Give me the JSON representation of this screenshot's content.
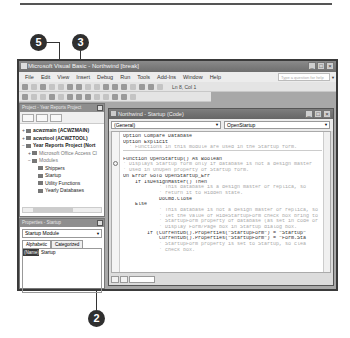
{
  "callouts": [
    {
      "number": "5"
    },
    {
      "number": "3"
    },
    {
      "number": "2"
    }
  ],
  "window": {
    "title": "Microsoft Visual Basic - Northwind [break]",
    "controls": [
      "_",
      "□",
      "×"
    ],
    "help_placeholder": "Type a question for help"
  },
  "menubar": [
    "File",
    "Edit",
    "View",
    "Insert",
    "Debug",
    "Run",
    "Tools",
    "Add-Ins",
    "Window",
    "Help"
  ],
  "toolbar": {
    "position": "Ln 8, Col 1"
  },
  "project_pane": {
    "title": "Project - Year Reports Project",
    "items": [
      {
        "toggle": "+",
        "label": "acwzmain (ACWZMAIN)",
        "bold": true,
        "indent": 0
      },
      {
        "toggle": "+",
        "label": "acwztool (ACWZTOOL)",
        "bold": true,
        "indent": 0
      },
      {
        "toggle": "−",
        "label": "Year Reports Project (Nort",
        "bold": true,
        "indent": 0
      },
      {
        "toggle": "+",
        "label": "Microsoft Office Access Cl",
        "bold": false,
        "indent": 1
      },
      {
        "toggle": "−",
        "label": "Modules",
        "bold": false,
        "indent": 1
      },
      {
        "toggle": "",
        "label": "Shippers",
        "bold": false,
        "indent": 2
      },
      {
        "toggle": "",
        "label": "Startup",
        "bold": false,
        "indent": 2
      },
      {
        "toggle": "",
        "label": "Utility Functions",
        "bold": false,
        "indent": 2
      },
      {
        "toggle": "",
        "label": "Yearly Databases",
        "bold": false,
        "indent": 2
      }
    ]
  },
  "properties_pane": {
    "title": "Properties - Startup",
    "selected_object": "Startup Module",
    "tabs": [
      "Alphabetic",
      "Categorized"
    ],
    "rows": [
      {
        "key": "(Name)",
        "value": "Startup"
      }
    ]
  },
  "code_window": {
    "title": "Northwind - Startup (Code)",
    "object_combo": "(General)",
    "procedure_combo": "OpenStartup",
    "lines": [
      {
        "text": "Option Compare Database",
        "type": "code"
      },
      {
        "text": "Option Explicit",
        "type": "code"
      },
      {
        "text": "  ' Functions in this module are used in the Startup form.",
        "type": "cmt",
        "sep": true
      },
      {
        "text": "",
        "type": "code"
      },
      {
        "text": "Function OpenStartup() As Boolean",
        "type": "code"
      },
      {
        "text": "' Displays Startup form only if database is not a design master",
        "type": "cmt"
      },
      {
        "text": "' Used in OnOpen property of Startup form.",
        "type": "cmt"
      },
      {
        "text": "On Error GoTo OpenStartup_Err",
        "type": "code"
      },
      {
        "text": "    If IsDesignMaster() Then",
        "type": "code"
      },
      {
        "text": "            ' This database is a design master or replica, so",
        "type": "cmt"
      },
      {
        "text": "            ' return it to Hidden state.",
        "type": "cmt"
      },
      {
        "text": "            DoCmd.Close",
        "type": "code"
      },
      {
        "text": "    Else",
        "type": "code"
      },
      {
        "text": "            ' This database is not a design master or replica, so",
        "type": "cmt"
      },
      {
        "text": "            ' let the value of HideStartupForm check box bring to",
        "type": "cmt"
      },
      {
        "text": "            ' StartupForm property of database (as set in code or",
        "type": "cmt"
      },
      {
        "text": "            ' Display Form/Page box in Startup dialog box.",
        "type": "cmt"
      },
      {
        "text": "        If (CurrentDb().Properties(\"StartupForm\") = \"Startup\"",
        "type": "code"
      },
      {
        "text": "            CurrentDb().Properties(\"StartupForm\") = \"Form.Sta",
        "type": "code"
      },
      {
        "text": "            ' StartupForm property is set to Startup, so clea",
        "type": "cmt"
      },
      {
        "text": "            ' check box.",
        "type": "cmt"
      }
    ]
  }
}
